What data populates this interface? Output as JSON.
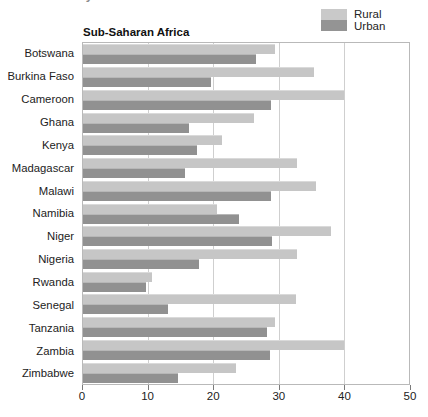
{
  "headline": {
    "cut_off_text": "by Residential Residence"
  },
  "legend": {
    "position": "top-right",
    "items": [
      {
        "label": "Rural",
        "color": "#c9c9c9",
        "name": "legend-rural"
      },
      {
        "label": "Urban",
        "color": "#949494",
        "name": "legend-urban"
      }
    ]
  },
  "panel": {
    "title": "Sub-Saharan Africa"
  },
  "axis": {
    "x_ticks": [
      "0",
      "10",
      "20",
      "30",
      "40",
      "50"
    ]
  },
  "chart_data": {
    "type": "bar",
    "orientation": "horizontal",
    "title": "Sub-Saharan Africa",
    "xlabel": "",
    "ylabel": "",
    "xlim": [
      0,
      50
    ],
    "grid": true,
    "legend_position": "top-right",
    "categories": [
      "Botswana",
      "Burkina Faso",
      "Cameroon",
      "Ghana",
      "Kenya",
      "Madagascar",
      "Malawi",
      "Namibia",
      "Niger",
      "Nigeria",
      "Rwanda",
      "Senegal",
      "Tanzania",
      "Zambia",
      "Zimbabwe"
    ],
    "series": [
      {
        "name": "Rural",
        "color": "#c6c6c6",
        "values": [
          29.5,
          35.5,
          40.0,
          26.3,
          21.3,
          32.8,
          35.8,
          20.6,
          38.0,
          32.8,
          10.6,
          32.7,
          29.4,
          40.0,
          23.5
        ]
      },
      {
        "name": "Urban",
        "color": "#919191",
        "values": [
          26.5,
          19.7,
          28.9,
          16.3,
          17.5,
          15.7,
          28.9,
          24.0,
          29.0,
          17.8,
          9.6,
          13.1,
          28.2,
          28.7,
          14.6
        ]
      }
    ]
  }
}
